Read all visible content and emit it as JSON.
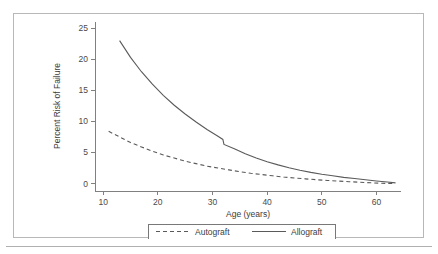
{
  "chart_data": {
    "type": "line",
    "title": "",
    "xlabel": "Age (years)",
    "ylabel": "Percent Risk of Failure",
    "xlim": [
      8.5,
      64.5
    ],
    "ylim": [
      -1.2,
      26
    ],
    "xticks": [
      10,
      20,
      30,
      40,
      50,
      60
    ],
    "xtick_labels": [
      "10",
      "20",
      "30",
      "40",
      "50",
      "60"
    ],
    "yticks": [
      0,
      5,
      10,
      15,
      20,
      25
    ],
    "ytick_labels": [
      "0",
      "5",
      "10",
      "15",
      "20",
      "25"
    ],
    "grid": false,
    "legend_position": "below-axes",
    "series": [
      {
        "name": "Autograft",
        "style": "dashed",
        "color": "#5a5a5a",
        "x": [
          11.0,
          13.0,
          15.0,
          17.0,
          19.0,
          21.0,
          23.0,
          25.0,
          27.0,
          29.0,
          31.0,
          33.0,
          35.0,
          37.0,
          39.0,
          41.0,
          43.0,
          45.0,
          47.0,
          49.0,
          51.0,
          53.0,
          55.0,
          57.0,
          59.0,
          61.0,
          63.0
        ],
        "y": [
          8.4,
          7.5,
          6.6,
          5.9,
          5.2,
          4.6,
          4.1,
          3.6,
          3.2,
          2.8,
          2.5,
          2.2,
          1.9,
          1.65,
          1.45,
          1.25,
          1.05,
          0.9,
          0.75,
          0.62,
          0.5,
          0.4,
          0.3,
          0.2,
          0.12,
          0.05,
          0.0
        ]
      },
      {
        "name": "Allograft",
        "style": "solid",
        "color": "#5a5a5a",
        "x": [
          13.0,
          15.0,
          17.0,
          19.0,
          21.0,
          23.0,
          25.0,
          27.0,
          29.0,
          31.0,
          31.9,
          32.1,
          34.0,
          36.0,
          38.0,
          40.0,
          42.0,
          44.0,
          46.0,
          48.0,
          50.0,
          52.0,
          54.0,
          56.0,
          58.0,
          60.0,
          62.0,
          63.5
        ],
        "y": [
          23.0,
          20.3,
          18.0,
          16.0,
          14.2,
          12.6,
          11.2,
          9.9,
          8.7,
          7.6,
          7.1,
          6.3,
          5.6,
          4.8,
          4.1,
          3.5,
          3.0,
          2.55,
          2.15,
          1.8,
          1.5,
          1.25,
          1.0,
          0.8,
          0.6,
          0.42,
          0.25,
          0.1
        ]
      }
    ],
    "annotations": []
  },
  "legend": {
    "entries": [
      {
        "label": "Autograft",
        "style": "dashed"
      },
      {
        "label": "Allograft",
        "style": "solid"
      }
    ]
  },
  "colors": {
    "line": "#5a5a5a",
    "axis": "#808080",
    "text": "#3c3c3c",
    "frame": "#b8b8b8",
    "rule": "#b0b0b0",
    "background": "#ffffff"
  }
}
